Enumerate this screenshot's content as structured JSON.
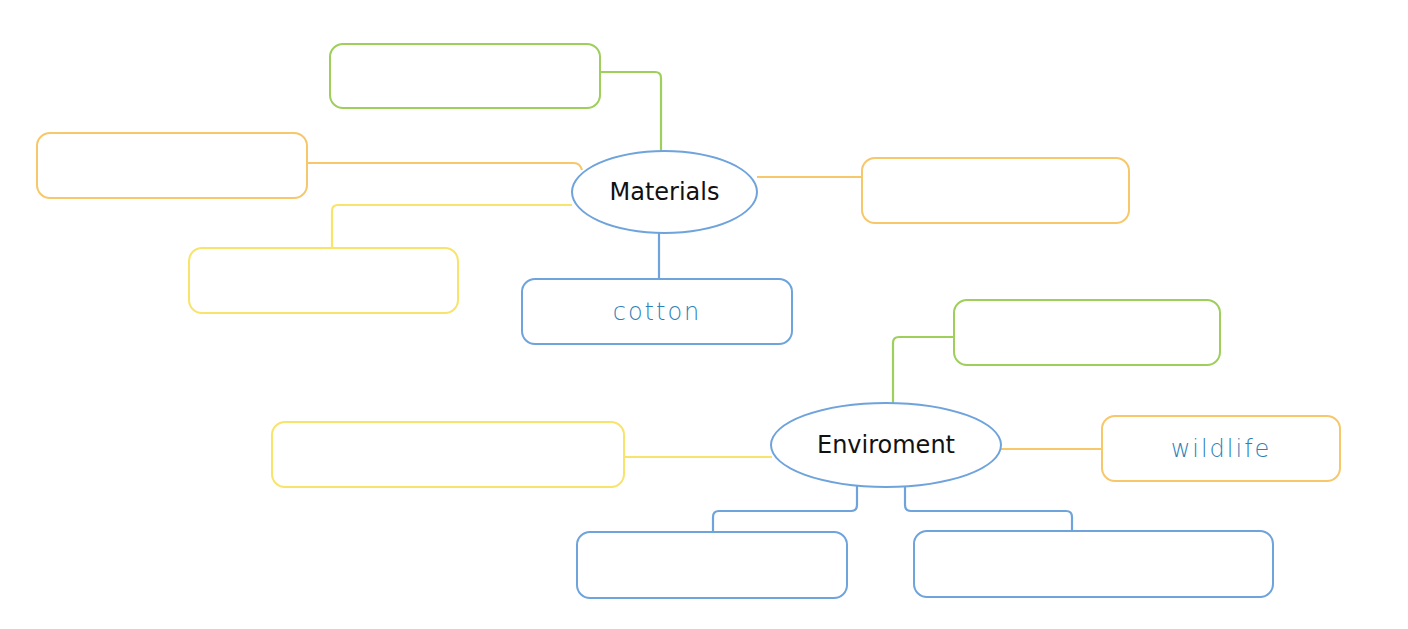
{
  "colors": {
    "blue": "#6fa3dc",
    "green": "#9dcf5a",
    "orange": "#f6c76b",
    "yellow": "#f8e46a",
    "text_handwritten": "#2f7fb8",
    "text_center": "#111111"
  },
  "map1": {
    "center": "Materials",
    "branches": [
      {
        "position": "top-left",
        "color": "green",
        "text": ""
      },
      {
        "position": "left",
        "color": "orange",
        "text": ""
      },
      {
        "position": "lower-left",
        "color": "yellow",
        "text": ""
      },
      {
        "position": "bottom",
        "color": "blue",
        "text": "cotton"
      },
      {
        "position": "right",
        "color": "orange",
        "text": ""
      }
    ]
  },
  "map2": {
    "center": "Enviroment",
    "branches": [
      {
        "position": "top-right",
        "color": "green",
        "text": ""
      },
      {
        "position": "left",
        "color": "yellow",
        "text": ""
      },
      {
        "position": "right",
        "color": "orange",
        "text": "wildlife"
      },
      {
        "position": "bottom-left",
        "color": "blue",
        "text": ""
      },
      {
        "position": "bottom-right",
        "color": "blue",
        "text": ""
      }
    ]
  }
}
